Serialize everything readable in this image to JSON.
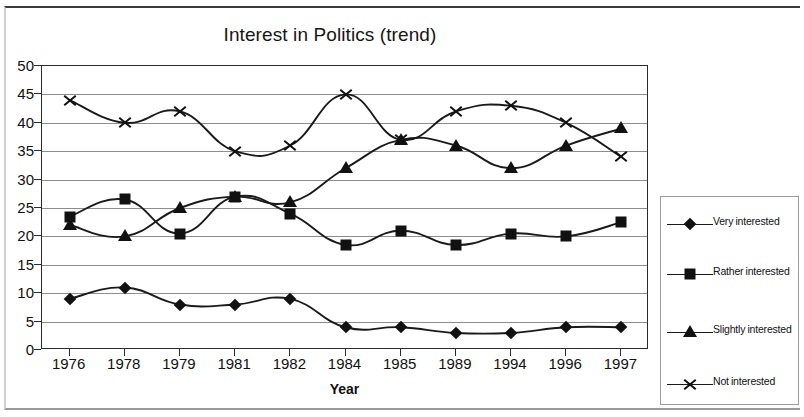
{
  "chart_data": {
    "type": "line",
    "title": "Interest in Politics (trend)",
    "xlabel": "Year",
    "ylabel": "",
    "categories": [
      "1976",
      "1978",
      "1979",
      "1981",
      "1982",
      "1984",
      "1985",
      "1989",
      "1994",
      "1996",
      "1997"
    ],
    "ylim": [
      0,
      50
    ],
    "ytick_step": 5,
    "yticks": [
      "50",
      "45",
      "40",
      "35",
      "30",
      "25",
      "20",
      "15",
      "10",
      "5",
      "0"
    ],
    "grid": true,
    "legend_position": "right",
    "series": [
      {
        "name": "Very interested",
        "marker": "diamond",
        "values": [
          9,
          11,
          8,
          8,
          9,
          4,
          4,
          3,
          3,
          4,
          4
        ]
      },
      {
        "name": "Rather interested",
        "marker": "square",
        "values": [
          23.5,
          26.5,
          20.5,
          27,
          24,
          18.5,
          21,
          18.5,
          20.5,
          20,
          22.5
        ]
      },
      {
        "name": "Slightly interested",
        "marker": "triangle",
        "values": [
          22,
          20,
          25,
          27,
          26,
          32,
          37,
          36,
          32,
          36,
          39
        ]
      },
      {
        "name": "Not interested",
        "marker": "x",
        "values": [
          44,
          40,
          42,
          35,
          36,
          45,
          37,
          42,
          43,
          40,
          34
        ]
      }
    ]
  },
  "legend": {
    "entries": [
      {
        "label": "Very interested"
      },
      {
        "label": "Rather interested"
      },
      {
        "label": "Slightly interested"
      },
      {
        "label": "Not interested"
      }
    ]
  }
}
